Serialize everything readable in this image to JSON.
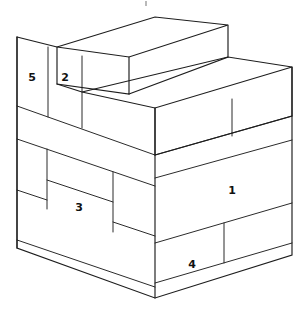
{
  "figure": {
    "title": "Isometric stacked block stair diagram",
    "background_color": "#ffffff",
    "line_color": "#1d1d1d",
    "label_color": "#111111",
    "width": 303,
    "height": 312,
    "projection": "isometric-cabinet",
    "artifact_speck": {
      "present": true,
      "x": 146,
      "y": 3,
      "color": "#b9b9b9"
    }
  },
  "blocks": [
    {
      "id": "block-1",
      "label": "1",
      "face": "right",
      "label_x": 232,
      "label_y": 191,
      "description": "large block on lower right face"
    },
    {
      "id": "block-2",
      "label": "2",
      "face": "left",
      "label_x": 65,
      "label_y": 78,
      "description": "upper riser block on left face"
    },
    {
      "id": "block-3",
      "label": "3",
      "face": "left",
      "label_x": 79,
      "label_y": 208,
      "description": "middle block on left face"
    },
    {
      "id": "block-4",
      "label": "4",
      "face": "right",
      "label_x": 192,
      "label_y": 265,
      "description": "bottom block on right face"
    },
    {
      "id": "block-5",
      "label": "5",
      "face": "left",
      "label_x": 32,
      "label_y": 78,
      "description": "top-left corner block on left face"
    }
  ],
  "geometry": {
    "outline": "M17,37 L17,248 L155,298 L292,255 L292,67 L228,25 L155,45 Z",
    "front_vertical_edge_x": 155,
    "left_top_corner": {
      "x": 17,
      "y": 37
    },
    "left_bottom_corner": {
      "x": 17,
      "y": 248
    },
    "front_bottom_corner": {
      "x": 155,
      "y": 298
    },
    "right_top_corner": {
      "x": 292,
      "y": 67
    },
    "right_bottom_corner": {
      "x": 292,
      "y": 255
    }
  }
}
